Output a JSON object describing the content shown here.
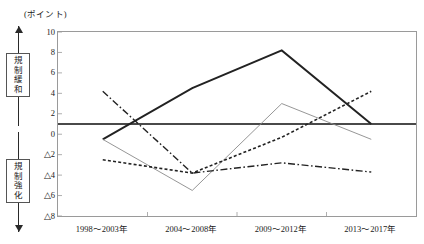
{
  "figure": {
    "title": "",
    "unit_label": "(ポイント)"
  },
  "annotations": {
    "upper": {
      "label": "規制緩和",
      "chars": [
        "規",
        "制",
        "緩",
        "和"
      ],
      "direction": "up"
    },
    "lower": {
      "label": "規制強化",
      "chars": [
        "規",
        "制",
        "強",
        "化"
      ],
      "direction": "down"
    }
  },
  "axis": {
    "y_ticks": [
      "10",
      "8",
      "6",
      "4",
      "2",
      "0",
      "△2",
      "△4",
      "△6",
      "△8"
    ],
    "y_values": [
      10,
      8,
      6,
      4,
      2,
      0,
      -2,
      -4,
      -6,
      -8
    ],
    "x_ticks": [
      "1998～2003年",
      "2004～2008年",
      "2009～2012年",
      "2013～2017年"
    ]
  },
  "chart_data": {
    "type": "line",
    "title": "",
    "xlabel": "",
    "ylabel": "(ポイント)",
    "ylim": [
      -8,
      10
    ],
    "grid": false,
    "legend": "none",
    "reference_line": {
      "value": 1,
      "style": "thick-solid",
      "color": "#4a4a4a"
    },
    "categories": [
      "1998～2003年",
      "2004～2008年",
      "2009～2012年",
      "2013～2017年"
    ],
    "series": [
      {
        "name": "series-1",
        "style": "thick-solid",
        "color": "#222222",
        "values": [
          -0.5,
          4.5,
          8.2,
          1.0
        ]
      },
      {
        "name": "series-2",
        "style": "thin-solid",
        "color": "#8a8a8a",
        "values": [
          -0.5,
          -5.5,
          3.0,
          -0.5
        ]
      },
      {
        "name": "series-3",
        "style": "dash-dot",
        "color": "#222222",
        "values": [
          4.2,
          -3.8,
          -2.8,
          -3.7
        ]
      },
      {
        "name": "series-4",
        "style": "dotted",
        "color": "#222222",
        "values": [
          -2.5,
          -3.8,
          -0.3,
          4.2
        ]
      }
    ]
  }
}
